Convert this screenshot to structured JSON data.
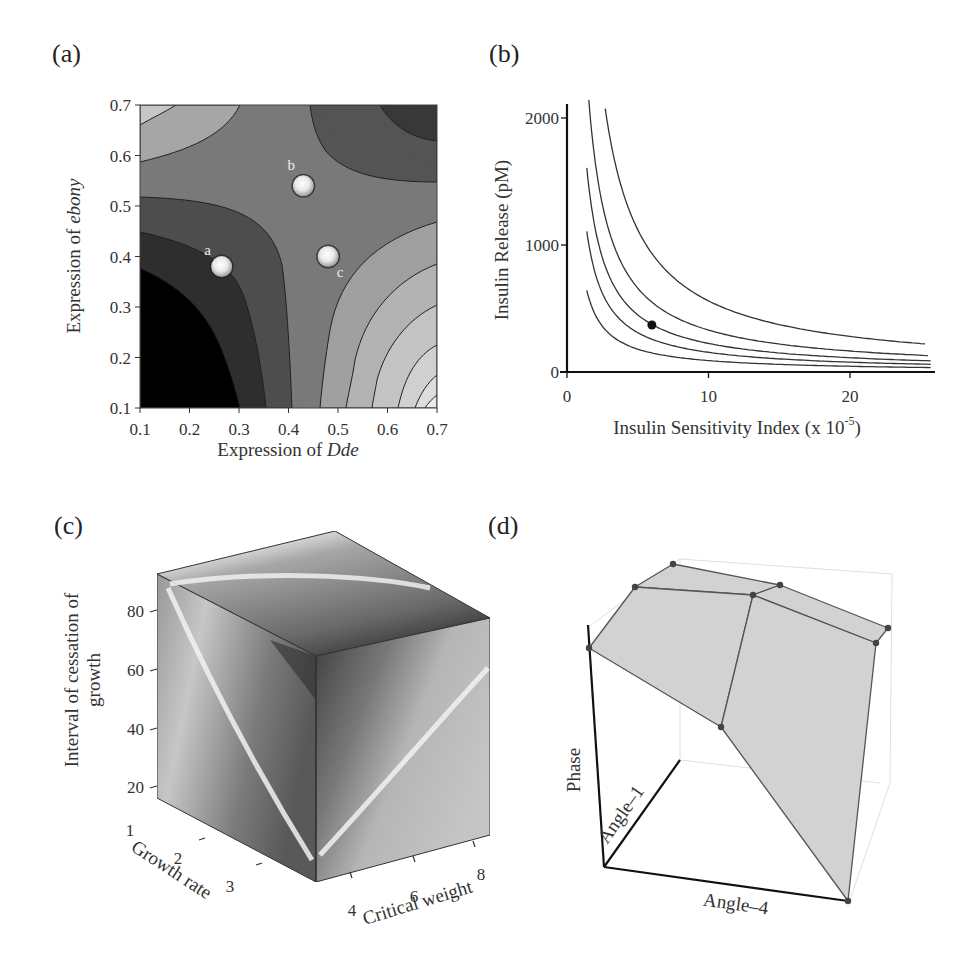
{
  "panels": {
    "a": {
      "label": "(a)"
    },
    "b": {
      "label": "(b)"
    },
    "c": {
      "label": "(c)"
    },
    "d": {
      "label": "(d)"
    }
  },
  "chart_data": [
    {
      "id": "a",
      "type": "heatmap",
      "subtype": "contour",
      "title": "",
      "xlabel_prefix": "Expression of ",
      "xlabel_italic": "Dde",
      "ylabel_prefix": "Expression of ",
      "ylabel_italic": "ebony",
      "xlim": [
        0.1,
        0.7
      ],
      "ylim": [
        0.1,
        0.7
      ],
      "xticks": [
        "0.1",
        "0.2",
        "0.3",
        "0.4",
        "0.5",
        "0.6",
        "0.7"
      ],
      "yticks": [
        "0.1",
        "0.2",
        "0.3",
        "0.4",
        "0.5",
        "0.6",
        "0.7"
      ],
      "description": "Saddle-shaped fitness surface; dark (low) in lower-left and upper-right corners, light (high) in upper-left and lower-right corners",
      "points": [
        {
          "label": "a",
          "x": 0.265,
          "y": 0.38
        },
        {
          "label": "b",
          "x": 0.43,
          "y": 0.54
        },
        {
          "label": "c",
          "x": 0.48,
          "y": 0.4
        }
      ]
    },
    {
      "id": "b",
      "type": "line",
      "title": "",
      "xlabel": "Insulin Sensitivity Index (x 10",
      "xlabel_sup": "-5",
      "xlabel_suffix": ")",
      "ylabel": "Insulin Release (pM)",
      "xlim": [
        0,
        25.5
      ],
      "ylim": [
        0,
        2100
      ],
      "xticks": [
        "0",
        "10",
        "20"
      ],
      "xtick_values": [
        0,
        10,
        20
      ],
      "yticks": [
        "0",
        "1000",
        "2000"
      ],
      "ytick_values": [
        0,
        1000,
        2000
      ],
      "series": [
        {
          "name": "curve-1",
          "k": 900,
          "x_start": 1.4,
          "x_end": 25.7
        },
        {
          "name": "curve-2",
          "k": 1550,
          "x_start": 1.4,
          "x_end": 25.7
        },
        {
          "name": "curve-3",
          "k": 2250,
          "x_start": 1.4,
          "x_end": 25.7
        },
        {
          "name": "curve-4",
          "k": 3300,
          "x_start": 1.5,
          "x_end": 25.5
        },
        {
          "name": "curve-5",
          "k": 5600,
          "x_start": 2.7,
          "x_end": 25.3
        }
      ],
      "series_form": "y = k / x (hyperbolic isoquants)",
      "highlight_point": {
        "x": 6.0,
        "y": 370
      }
    },
    {
      "id": "c",
      "type": "heatmap",
      "subtype": "3d-cube-volume",
      "title": "",
      "zlabel_line1": "Interval of cessation of",
      "zlabel_line2": "growth",
      "xlabel": "Growth rate",
      "ylabel": "Critical weight",
      "zticks": [
        "20",
        "40",
        "60",
        "80"
      ],
      "xticks": [
        "1",
        "2",
        "3"
      ],
      "yticks": [
        "4",
        "6",
        "8"
      ]
    },
    {
      "id": "d",
      "type": "scatter",
      "subtype": "3d-polyhedral-surface",
      "title": "",
      "zlabel": "Phase",
      "xlabel": "Angle–4",
      "ylabel": "Angle–1",
      "vertex_count": 9
    }
  ]
}
